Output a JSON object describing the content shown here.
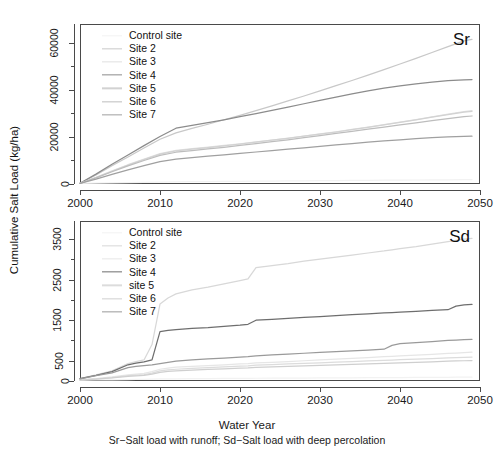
{
  "figure": {
    "ylabel": "Cumulative Salt Load (kg/ha)",
    "xlabel": "Water Year",
    "caption": "Sr−Salt load with runoff; Sd−Salt load with deep percolation"
  },
  "legend_items": [
    {
      "label": "Control site",
      "color": "#f2f2f2"
    },
    {
      "label": "Site 2",
      "color": "#c8c8c8"
    },
    {
      "label": "Site 3",
      "color": "#e0e0e0"
    },
    {
      "label": "Site 4",
      "color": "#8c8c8c"
    },
    {
      "label": "Site 5",
      "color": "#d2d2d2"
    },
    {
      "label": "Site 6",
      "color": "#bdbdbd"
    },
    {
      "label": "Site 7",
      "color": "#a0a0a0"
    }
  ],
  "legend_items_bottom": [
    {
      "label": "Control site",
      "color": "#f2f2f2"
    },
    {
      "label": "Site 2",
      "color": "#d8d8d8"
    },
    {
      "label": "Site 3",
      "color": "#e6e6e6"
    },
    {
      "label": "Site 4",
      "color": "#6e6e6e"
    },
    {
      "label": "site 5",
      "color": "#dcdcdc"
    },
    {
      "label": "Site 6",
      "color": "#cfcfcf"
    },
    {
      "label": "Site 7",
      "color": "#9a9a9a"
    }
  ],
  "chart_data": [
    {
      "type": "line",
      "panel_tag": "Sr",
      "title": "",
      "xlabel": "Water Year",
      "ylabel": "Cumulative Salt Load (kg/ha)",
      "xlim": [
        2000,
        2050
      ],
      "ylim": [
        0,
        68000
      ],
      "xticks": [
        2000,
        2010,
        2020,
        2030,
        2040,
        2050
      ],
      "yticks": [
        0,
        20000,
        40000,
        60000
      ],
      "yticks_minor": [
        10000,
        30000,
        50000
      ],
      "grid": false,
      "legend_position": "top-left",
      "x": [
        2000,
        2002,
        2004,
        2006,
        2008,
        2010,
        2012,
        2014,
        2016,
        2018,
        2020,
        2022,
        2024,
        2026,
        2028,
        2030,
        2032,
        2034,
        2036,
        2038,
        2040,
        2042,
        2044,
        2046,
        2048,
        2049
      ],
      "series": [
        {
          "name": "Control site",
          "color": "#f2f2f2",
          "values": [
            300,
            400,
            500,
            600,
            700,
            800,
            900,
            1000,
            1050,
            1100,
            1150,
            1200,
            1250,
            1300,
            1350,
            1400,
            1450,
            1500,
            1550,
            1600,
            1650,
            1700,
            1750,
            1800,
            1850,
            1870
          ]
        },
        {
          "name": "Site 2",
          "color": "#c8c8c8",
          "values": [
            300,
            3800,
            7800,
            11500,
            15300,
            19000,
            21700,
            23600,
            25400,
            27300,
            29200,
            31200,
            33200,
            35300,
            37400,
            39600,
            41800,
            44000,
            46300,
            48600,
            51000,
            53400,
            55900,
            58400,
            60800,
            61500
          ]
        },
        {
          "name": "Site 3",
          "color": "#e0e0e0",
          "values": [
            300,
            2800,
            5600,
            8200,
            10600,
            12900,
            14300,
            15000,
            15700,
            16400,
            17100,
            17900,
            18700,
            19500,
            20400,
            21300,
            22200,
            23200,
            24200,
            25200,
            26300,
            27400,
            28500,
            29700,
            30800,
            31200
          ]
        },
        {
          "name": "Site 4",
          "color": "#8c8c8c",
          "values": [
            300,
            4200,
            8400,
            12300,
            16300,
            20200,
            23700,
            24900,
            26100,
            27300,
            28600,
            29900,
            31300,
            32700,
            34100,
            35500,
            36900,
            38300,
            39600,
            40700,
            41700,
            42600,
            43300,
            43900,
            44300,
            44400
          ]
        },
        {
          "name": "Site 5",
          "color": "#d2d2d2",
          "values": [
            300,
            2700,
            5400,
            8000,
            10400,
            12700,
            14100,
            14800,
            15500,
            16200,
            17000,
            17800,
            18600,
            19400,
            20300,
            21200,
            22100,
            23100,
            24100,
            25100,
            26200,
            27300,
            28400,
            29500,
            30500,
            30900
          ]
        },
        {
          "name": "Site 6",
          "color": "#bdbdbd",
          "values": [
            300,
            2600,
            5200,
            7700,
            10000,
            12200,
            13500,
            14200,
            14900,
            15600,
            16400,
            17200,
            18000,
            18800,
            19700,
            20600,
            21500,
            22400,
            23300,
            24200,
            25100,
            26000,
            26900,
            27800,
            28600,
            28900
          ]
        },
        {
          "name": "Site 7",
          "color": "#a0a0a0",
          "values": [
            300,
            2100,
            4100,
            6000,
            7800,
            9500,
            10600,
            11200,
            11800,
            12400,
            13000,
            13600,
            14200,
            14800,
            15400,
            16000,
            16600,
            17200,
            17800,
            18300,
            18800,
            19300,
            19700,
            20000,
            20200,
            20300
          ]
        }
      ]
    },
    {
      "type": "line",
      "panel_tag": "Sd",
      "title": "",
      "xlabel": "Water Year",
      "ylabel": "Cumulative Salt Load (kg/ha)",
      "xlim": [
        2000,
        2050
      ],
      "ylim": [
        0,
        3950
      ],
      "xticks": [
        2000,
        2010,
        2020,
        2030,
        2040,
        2050
      ],
      "yticks": [
        0,
        500,
        1500,
        2500,
        3500
      ],
      "yticks_minor": [
        1000,
        2000,
        3000
      ],
      "grid": false,
      "legend_position": "top-left",
      "x": [
        2000,
        2002,
        2004,
        2006,
        2007,
        2008,
        2009,
        2010,
        2011,
        2012,
        2014,
        2016,
        2018,
        2020,
        2021,
        2022,
        2024,
        2026,
        2028,
        2030,
        2032,
        2034,
        2036,
        2038,
        2039,
        2040,
        2042,
        2044,
        2046,
        2047,
        2048,
        2049
      ],
      "series": [
        {
          "name": "Control site",
          "color": "#f2f2f2",
          "values": [
            20,
            25,
            30,
            35,
            38,
            40,
            45,
            50,
            52,
            55,
            58,
            60,
            63,
            65,
            66,
            68,
            70,
            72,
            74,
            76,
            78,
            80,
            82,
            84,
            85,
            86,
            88,
            90,
            92,
            93,
            94,
            95
          ]
        },
        {
          "name": "Site 2",
          "color": "#d8d8d8",
          "values": [
            60,
            150,
            250,
            430,
            480,
            520,
            900,
            1900,
            2050,
            2150,
            2250,
            2320,
            2400,
            2480,
            2520,
            2800,
            2850,
            2900,
            2960,
            3010,
            3060,
            3110,
            3160,
            3210,
            3240,
            3270,
            3320,
            3380,
            3440,
            3470,
            3500,
            3520
          ]
        },
        {
          "name": "Site 3",
          "color": "#e6e6e6",
          "values": [
            30,
            60,
            100,
            150,
            170,
            190,
            230,
            290,
            320,
            340,
            360,
            380,
            400,
            420,
            430,
            445,
            460,
            480,
            500,
            520,
            540,
            560,
            580,
            600,
            610,
            620,
            640,
            660,
            680,
            690,
            700,
            710
          ]
        },
        {
          "name": "Site 4",
          "color": "#6e6e6e",
          "values": [
            60,
            140,
            230,
            400,
            440,
            470,
            520,
            1220,
            1250,
            1270,
            1300,
            1320,
            1350,
            1380,
            1400,
            1500,
            1520,
            1545,
            1570,
            1590,
            1615,
            1640,
            1660,
            1680,
            1690,
            1700,
            1720,
            1745,
            1760,
            1850,
            1880,
            1890
          ]
        },
        {
          "name": "site 5",
          "color": "#dcdcdc",
          "values": [
            25,
            50,
            85,
            130,
            145,
            160,
            195,
            250,
            275,
            290,
            310,
            330,
            350,
            365,
            375,
            390,
            405,
            420,
            435,
            450,
            465,
            480,
            495,
            510,
            518,
            525,
            540,
            555,
            570,
            578,
            585,
            592
          ]
        },
        {
          "name": "Site 6",
          "color": "#cfcfcf",
          "values": [
            22,
            45,
            75,
            115,
            128,
            140,
            170,
            215,
            235,
            250,
            268,
            285,
            300,
            315,
            322,
            335,
            350,
            362,
            375,
            388,
            400,
            412,
            425,
            438,
            444,
            450,
            462,
            475,
            488,
            494,
            500,
            505
          ]
        },
        {
          "name": "Site 7",
          "color": "#9a9a9a",
          "values": [
            55,
            130,
            200,
            330,
            360,
            380,
            400,
            430,
            460,
            490,
            520,
            545,
            565,
            590,
            600,
            620,
            645,
            665,
            685,
            705,
            725,
            745,
            765,
            785,
            880,
            920,
            950,
            975,
            1000,
            1010,
            1020,
            1030
          ]
        }
      ]
    }
  ]
}
